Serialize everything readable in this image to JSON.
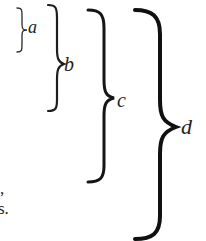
{
  "figure": {
    "braces": [
      {
        "id": "a",
        "label": "a"
      },
      {
        "id": "b",
        "label": "b"
      },
      {
        "id": "c",
        "label": "c"
      },
      {
        "id": "d",
        "label": "d"
      }
    ]
  },
  "cropped_text": {
    "line1": ",",
    "line2": "s."
  },
  "colors": {
    "ink": "#1a1a1a",
    "paper": "#ffffff"
  }
}
